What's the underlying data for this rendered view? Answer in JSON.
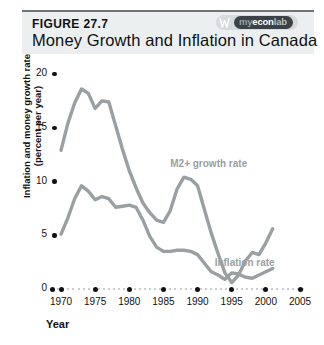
{
  "header": {
    "figure_label": "FIGURE 27.7",
    "title": "Money Growth and Inflation in Canada",
    "logo": {
      "mark": "w-icon",
      "my": "my",
      "econ": "econ",
      "lab": "lab"
    }
  },
  "chart_data": {
    "type": "line",
    "title": "Money Growth and Inflation in Canada",
    "xlabel": "Year",
    "ylabel": "Inflation and money growth rate (percent per year)",
    "ylabel_line1": "Inflation and money growth rate",
    "ylabel_line2": "(percent per year)",
    "xlim": [
      1970,
      2005
    ],
    "ylim": [
      0,
      20
    ],
    "yticks": [
      20,
      15,
      10,
      5,
      0
    ],
    "xticks": [
      1970,
      1975,
      1980,
      1985,
      1990,
      1995,
      2000,
      2005
    ],
    "grid": false,
    "legend": "inline-annotations",
    "annotations": [
      {
        "text": "M2+ growth rate",
        "x": 1986.0,
        "y": 11.6
      },
      {
        "text": "Inflation rate",
        "x": 1992.5,
        "y": 2.4
      }
    ],
    "series": [
      {
        "name": "M2+ growth rate",
        "color": "#9a9fa2",
        "x": [
          1970,
          1971,
          1972,
          1973,
          1974,
          1975,
          1976,
          1977,
          1978,
          1979,
          1980,
          1981,
          1982,
          1983,
          1984,
          1985,
          1986,
          1987,
          1988,
          1989,
          1990,
          1991,
          1992,
          1993,
          1994,
          1995,
          1996,
          1997,
          1998,
          1999,
          2000,
          2001
        ],
        "values": [
          12.9,
          15.4,
          17.3,
          18.6,
          18.2,
          16.8,
          17.5,
          17.4,
          15.2,
          13.0,
          11.0,
          9.4,
          8.0,
          7.1,
          6.4,
          6.2,
          7.3,
          9.3,
          10.4,
          10.2,
          9.6,
          7.4,
          5.2,
          3.3,
          1.5,
          0.6,
          1.3,
          2.6,
          3.4,
          3.2,
          4.3,
          5.6
        ]
      },
      {
        "name": "Inflation rate",
        "color": "#9a9fa2",
        "x": [
          1970,
          1971,
          1972,
          1973,
          1974,
          1975,
          1976,
          1977,
          1978,
          1979,
          1980,
          1981,
          1982,
          1983,
          1984,
          1985,
          1986,
          1987,
          1988,
          1989,
          1990,
          1991,
          1992,
          1993,
          1994,
          1995,
          1996,
          1997,
          1998,
          1999,
          2000,
          2001
        ],
        "values": [
          5.1,
          6.6,
          8.4,
          9.6,
          9.1,
          8.3,
          8.6,
          8.4,
          7.6,
          7.7,
          7.8,
          7.6,
          6.4,
          4.9,
          3.9,
          3.5,
          3.5,
          3.6,
          3.6,
          3.5,
          3.2,
          2.4,
          1.6,
          1.3,
          0.9,
          1.5,
          1.4,
          1.1,
          1.0,
          1.3,
          1.6,
          1.9
        ]
      }
    ]
  }
}
